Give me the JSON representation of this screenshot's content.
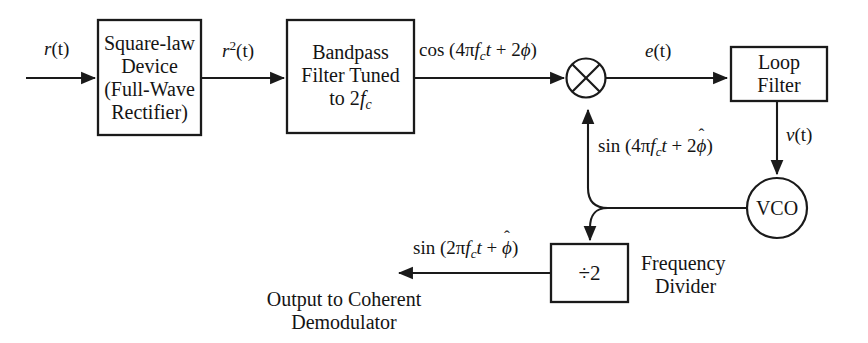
{
  "diagram": {
    "background_color": "#ffffff",
    "line_color": "#1a1a1a",
    "blocks": [
      {
        "id": "square-law-device",
        "label_lines": [
          "Square-law",
          "Device",
          "(Full-Wave",
          "Rectifier)"
        ],
        "shape": "rectangle"
      },
      {
        "id": "bandpass-filter",
        "label_lines": [
          "Bandpass",
          "Filter Tuned",
          "to 2fc"
        ],
        "shape": "rectangle"
      },
      {
        "id": "multiplier",
        "label": "",
        "shape": "circle-with-x"
      },
      {
        "id": "loop-filter",
        "label_lines": [
          "Loop",
          "Filter"
        ],
        "shape": "rectangle"
      },
      {
        "id": "vco",
        "label": "VCO",
        "shape": "circle"
      },
      {
        "id": "frequency-divider",
        "label": "÷2",
        "shape": "rectangle",
        "caption_lines": [
          "Frequency",
          "Divider"
        ]
      }
    ],
    "signal_labels": {
      "input": "r(t)",
      "squared": "r2(t)",
      "bandpass_output": "cos (4πfct + 2ϕ)",
      "error": "e(t)",
      "control_voltage": "v(t)",
      "vco_feedback": "sin (4πfct + 2ϕ̂)",
      "divider_output": "sin (2πfct + ϕ̂)"
    },
    "captions": {
      "output_line1": "Output to Coherent",
      "output_line2": "Demodulator",
      "divider_line1": "Frequency",
      "divider_line2": "Divider"
    },
    "block_text": {
      "square_law_l1": "Square-law",
      "square_law_l2": "Device",
      "square_law_l3": "(Full-Wave",
      "square_law_l4": "Rectifier)",
      "bandpass_l1": "Bandpass",
      "bandpass_l2": "Filter Tuned",
      "bandpass_l3_prefix": "to 2",
      "bandpass_l3_f": "f",
      "bandpass_l3_sub": "c",
      "loop_filter_l1": "Loop",
      "loop_filter_l2": "Filter",
      "vco": "VCO",
      "divider": "÷2"
    },
    "math_atoms": {
      "r": "r",
      "two": "2",
      "paren_t": "(t)",
      "cos": "cos",
      "sin": "sin",
      "open_paren": "(",
      "close_paren": ")",
      "four_pi": "4π",
      "two_pi": "2π",
      "f": "f",
      "c": "c",
      "t": "t",
      "plus": "+",
      "two_phi_coeff": "2",
      "phi": "ϕ",
      "hat": "ˆ",
      "e": "e",
      "v": "v"
    }
  }
}
